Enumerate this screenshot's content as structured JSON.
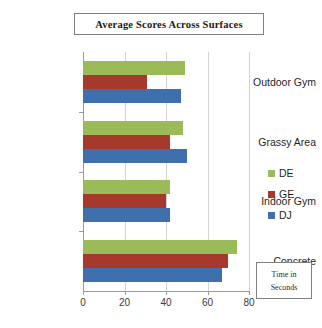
{
  "chart_data": {
    "type": "bar",
    "orientation": "horizontal",
    "title": "Average Scores Across Surfaces",
    "xlabel": "Time in Seconds",
    "ylabel": "",
    "xlim": [
      0,
      80
    ],
    "xticks": [
      0,
      20,
      40,
      60,
      80
    ],
    "xtick_labels": [
      "0",
      "20",
      "40",
      "60",
      "80"
    ],
    "grid": true,
    "grid_axis": "x",
    "legend_position": "right",
    "categories": [
      "Outdoor Gym",
      "Grassy Area",
      "Indoor Gym",
      "Concrete"
    ],
    "series": [
      {
        "name": "DE",
        "color": "#9BBB59",
        "values": [
          49,
          48,
          42,
          74
        ]
      },
      {
        "name": "GE",
        "color": "#A6382C",
        "values": [
          31,
          42,
          40,
          70
        ]
      },
      {
        "name": "DJ",
        "color": "#3F6FAC",
        "values": [
          47,
          50,
          42,
          67
        ]
      }
    ]
  },
  "title_box": {
    "text": "Average Scores Across Surfaces"
  },
  "legend": {
    "items": [
      {
        "label": "DE",
        "color": "#9BBB59"
      },
      {
        "label": "GE",
        "color": "#A6382C"
      },
      {
        "label": "DJ",
        "color": "#3F6FAC"
      }
    ]
  },
  "axis_note": {
    "line1": "Time in",
    "line2": "Seconds"
  },
  "axis": {
    "tick_labels": [
      "0",
      "20",
      "40",
      "60",
      "80"
    ],
    "category_labels": [
      "Outdoor Gym",
      "Grassy Area",
      "Indoor Gym",
      "Concrete"
    ]
  },
  "colors": {
    "series_de": "#9BBB59",
    "series_ge": "#A6382C",
    "series_dj": "#3F6FAC",
    "gridline": "#d4d4d4",
    "axis": "#9a9a9a",
    "background": "#ffffff"
  }
}
